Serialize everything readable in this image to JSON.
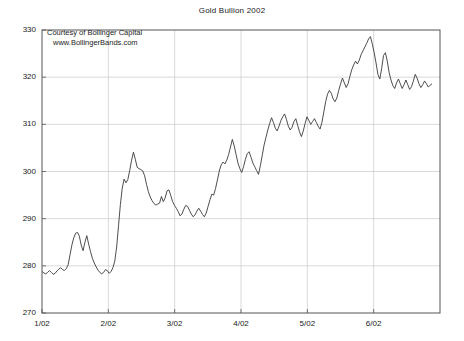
{
  "chart_data": {
    "type": "line",
    "title": "Gold Bullion 2002",
    "xlabel": "",
    "ylabel": "",
    "ylim": [
      270,
      330
    ],
    "yticks": [
      270,
      280,
      290,
      300,
      310,
      320,
      330
    ],
    "xticks": [
      "1/02",
      "2/02",
      "3/02",
      "4/02",
      "5/02",
      "6/02"
    ],
    "grid": true,
    "legend": null,
    "line_color": "#3a3a3a",
    "annotations": [
      "Courtesy of Bollinger Capital",
      "www.BollingerBands.com"
    ],
    "series": [
      {
        "name": "Gold Bullion",
        "x_start": "1/02",
        "x_end": "6/02",
        "values": [
          278.8,
          278.5,
          278.3,
          278.6,
          279.0,
          278.6,
          278.2,
          278.4,
          278.9,
          279.3,
          279.6,
          279.2,
          279.0,
          279.4,
          280.2,
          282.3,
          284.4,
          285.9,
          286.9,
          287.1,
          286.3,
          284.4,
          283.2,
          285.0,
          286.4,
          284.6,
          283.0,
          281.6,
          280.6,
          279.8,
          279.1,
          278.6,
          278.3,
          278.6,
          279.2,
          279.0,
          278.4,
          278.8,
          279.6,
          281.0,
          284.0,
          288.5,
          293.0,
          296.5,
          298.4,
          297.6,
          298.3,
          300.2,
          302.4,
          304.1,
          302.6,
          300.9,
          300.6,
          300.4,
          300.1,
          299.1,
          297.3,
          295.7,
          294.6,
          293.8,
          293.2,
          292.9,
          293.1,
          293.3,
          294.7,
          293.6,
          294.4,
          295.9,
          296.1,
          294.9,
          293.6,
          292.8,
          292.2,
          291.5,
          290.6,
          291.0,
          292.0,
          292.8,
          292.6,
          291.8,
          291.0,
          290.4,
          290.8,
          291.6,
          292.2,
          291.6,
          290.9,
          290.4,
          291.2,
          292.6,
          294.0,
          295.2,
          295.0,
          296.4,
          298.2,
          300.1,
          301.4,
          302.0,
          301.6,
          302.4,
          303.6,
          305.2,
          306.8,
          305.4,
          303.6,
          301.8,
          300.6,
          299.8,
          301.0,
          302.6,
          303.8,
          304.2,
          303.0,
          301.8,
          301.0,
          300.2,
          299.4,
          301.2,
          303.4,
          305.6,
          307.2,
          308.8,
          310.2,
          311.4,
          310.4,
          309.2,
          308.6,
          309.6,
          310.8,
          311.6,
          312.2,
          311.0,
          309.6,
          308.8,
          309.4,
          310.6,
          311.2,
          309.8,
          308.4,
          307.4,
          308.6,
          310.2,
          311.6,
          310.8,
          310.0,
          310.6,
          311.2,
          310.4,
          309.6,
          309.0,
          310.4,
          312.6,
          314.8,
          316.4,
          317.2,
          316.6,
          315.4,
          314.8,
          315.6,
          317.2,
          318.6,
          319.8,
          318.8,
          317.8,
          318.6,
          320.2,
          321.6,
          322.6,
          323.4,
          322.8,
          323.6,
          324.8,
          325.6,
          326.4,
          327.2,
          328.1,
          328.6,
          327.0,
          325.2,
          323.0,
          320.6,
          319.6,
          321.8,
          324.6,
          325.2,
          323.4,
          321.0,
          319.4,
          318.2,
          317.6,
          318.8,
          319.6,
          318.6,
          317.6,
          318.4,
          319.4,
          318.4,
          317.4,
          318.0,
          319.2,
          320.6,
          319.8,
          318.6,
          317.8,
          318.4,
          319.2,
          318.6,
          317.9,
          318.3,
          318.6
        ]
      }
    ]
  }
}
